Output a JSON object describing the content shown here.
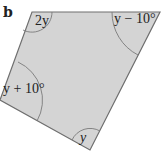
{
  "figure": {
    "part_label": "b",
    "shape": "quadrilateral",
    "fill_color": "#d4d4d4",
    "stroke_color": "#6e6e6e",
    "vertices": [
      {
        "name": "top-left",
        "x": 32,
        "y": 12,
        "angle_label": "2y"
      },
      {
        "name": "top-right",
        "x": 160,
        "y": 12,
        "angle_label": "y − 10°"
      },
      {
        "name": "bottom",
        "x": 90,
        "y": 150,
        "angle_label": "y"
      },
      {
        "name": "left",
        "x": 0,
        "y": 100,
        "angle_label": "y + 10°"
      }
    ]
  }
}
